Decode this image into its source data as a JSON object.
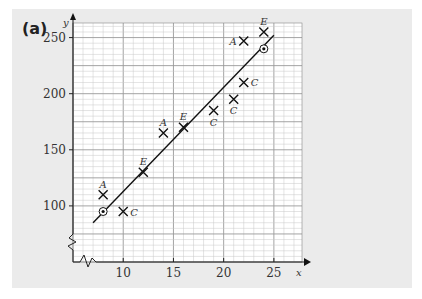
{
  "chart_data": {
    "type": "scatter",
    "panel_label": "(a)",
    "title": "",
    "xlabel": "x",
    "ylabel": "y",
    "xlim": [
      5,
      27.8
    ],
    "ylim": [
      50,
      263
    ],
    "grid": true,
    "xticks": [
      10,
      15,
      20,
      25
    ],
    "xtick_labels": [
      "10",
      "15",
      "20",
      "25"
    ],
    "yticks": [
      100,
      150,
      200,
      250
    ],
    "ytick_labels": [
      "100",
      "150",
      "200",
      "250"
    ],
    "axis_breaks": [
      "x",
      "y"
    ],
    "series": [
      {
        "name": "A",
        "marker": "cross",
        "points": [
          [
            8,
            110
          ],
          [
            14,
            165
          ],
          [
            22,
            247
          ]
        ]
      },
      {
        "name": "C",
        "marker": "cross",
        "points": [
          [
            10,
            95
          ],
          [
            19,
            185
          ],
          [
            21,
            195
          ],
          [
            22,
            210
          ]
        ]
      },
      {
        "name": "E",
        "marker": "cross",
        "points": [
          [
            12,
            130
          ],
          [
            16,
            170
          ],
          [
            24,
            255
          ]
        ]
      },
      {
        "name": "fixed",
        "marker": "circled-dot",
        "points": [
          [
            8,
            95
          ],
          [
            24,
            240
          ]
        ]
      }
    ],
    "point_labels": [
      {
        "text": "A",
        "x": 8,
        "y": 110,
        "pos": "above"
      },
      {
        "text": "C",
        "x": 10,
        "y": 95,
        "pos": "right"
      },
      {
        "text": "E",
        "x": 12,
        "y": 130,
        "pos": "above"
      },
      {
        "text": "A",
        "x": 14,
        "y": 165,
        "pos": "above"
      },
      {
        "text": "E",
        "x": 16,
        "y": 170,
        "pos": "above"
      },
      {
        "text": "C",
        "x": 19,
        "y": 185,
        "pos": "below"
      },
      {
        "text": "C",
        "x": 21,
        "y": 195,
        "pos": "below"
      },
      {
        "text": "C",
        "x": 22,
        "y": 210,
        "pos": "right"
      },
      {
        "text": "A",
        "x": 22,
        "y": 247,
        "pos": "left"
      },
      {
        "text": "E",
        "x": 24,
        "y": 255,
        "pos": "above"
      }
    ],
    "line": {
      "name": "line of best fit",
      "from": [
        7,
        85
      ],
      "to": [
        25,
        252
      ]
    }
  }
}
